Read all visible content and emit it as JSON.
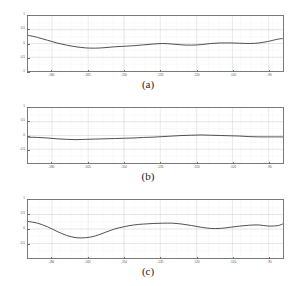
{
  "figure": {
    "background": "#ffffff",
    "line_color": "#3a3a3a",
    "grid_color": "#cfcfcf",
    "axis_color": "#7a7a7a"
  },
  "panels": [
    {
      "caption": "(a)",
      "chart_data": {
        "type": "line",
        "title": "",
        "xlabel": "",
        "ylabel": "",
        "xlim": [
          -190,
          -84
        ],
        "ylim": [
          -1.0,
          1.0
        ],
        "xticks": [
          -180,
          -165,
          -150,
          -135,
          -120,
          -105,
          -90
        ],
        "xticklabels": [
          "-180",
          "-165",
          "-150",
          "-135",
          "-120",
          "-105",
          "-90"
        ],
        "yticks": [
          -1,
          -0.5,
          0,
          0.5,
          1
        ],
        "yticklabels": [
          "-1",
          "-0.5",
          "0",
          "0.5",
          "1"
        ],
        "grid": true,
        "legend": "none",
        "series": [
          {
            "name": "curve-a",
            "x": [
              -190,
              -186,
              -182,
              -178,
              -174,
              -170,
              -166,
              -162,
              -158,
              -154,
              -150,
              -146,
              -142,
              -138,
              -134,
              -130,
              -126,
              -122,
              -118,
              -114,
              -110,
              -106,
              -102,
              -98,
              -94,
              -90,
              -86,
              -84
            ],
            "y": [
              0.3,
              0.22,
              0.12,
              0.02,
              -0.06,
              -0.12,
              -0.16,
              -0.17,
              -0.15,
              -0.12,
              -0.1,
              -0.08,
              -0.05,
              -0.02,
              0.0,
              -0.02,
              -0.05,
              -0.06,
              -0.04,
              0.0,
              0.02,
              0.02,
              0.01,
              0.0,
              0.02,
              0.08,
              0.16,
              0.18
            ]
          }
        ]
      }
    },
    {
      "caption": "(b)",
      "chart_data": {
        "type": "line",
        "title": "",
        "xlabel": "",
        "ylabel": "",
        "xlim": [
          -190,
          -84
        ],
        "ylim": [
          -1.0,
          1.0
        ],
        "xticks": [
          -180,
          -165,
          -150,
          -135,
          -120,
          -105,
          -90
        ],
        "xticklabels": [
          "-180",
          "-165",
          "-150",
          "-135",
          "-120",
          "-105",
          "-90"
        ],
        "yticks": [
          -0.5,
          0,
          0.5,
          1
        ],
        "yticklabels": [
          "-0.5",
          "0",
          "0.5",
          "1"
        ],
        "grid": true,
        "legend": "none",
        "series": [
          {
            "name": "curve-b",
            "x": [
              -190,
              -186,
              -182,
              -178,
              -174,
              -170,
              -166,
              -162,
              -158,
              -154,
              -150,
              -146,
              -142,
              -138,
              -134,
              -130,
              -126,
              -122,
              -118,
              -114,
              -110,
              -106,
              -102,
              -98,
              -94,
              -90,
              -86,
              -84
            ],
            "y": [
              -0.06,
              -0.07,
              -0.09,
              -0.12,
              -0.14,
              -0.15,
              -0.14,
              -0.13,
              -0.12,
              -0.11,
              -0.1,
              -0.09,
              -0.07,
              -0.06,
              -0.04,
              -0.02,
              0.0,
              0.01,
              0.02,
              0.01,
              0.0,
              -0.01,
              -0.02,
              -0.04,
              -0.05,
              -0.05,
              -0.05,
              -0.05
            ]
          }
        ]
      }
    },
    {
      "caption": "(c)",
      "chart_data": {
        "type": "line",
        "title": "",
        "xlabel": "",
        "ylabel": "",
        "xlim": [
          -190,
          -84
        ],
        "ylim": [
          -1.0,
          1.0
        ],
        "xticks": [
          -180,
          -165,
          -150,
          -135,
          -120,
          -105,
          -90
        ],
        "xticklabels": [
          "-180",
          "-165",
          "-150",
          "-135",
          "-120",
          "-105",
          "-90"
        ],
        "yticks": [
          -0.5,
          0,
          0.5,
          1
        ],
        "yticklabels": [
          "-0.5",
          "0",
          "0.5",
          "1"
        ],
        "grid": true,
        "legend": "none",
        "series": [
          {
            "name": "curve-c",
            "x": [
              -190,
              -186,
              -182,
              -178,
              -174,
              -170,
              -166,
              -162,
              -158,
              -154,
              -150,
              -146,
              -142,
              -138,
              -134,
              -130,
              -126,
              -122,
              -118,
              -114,
              -110,
              -106,
              -102,
              -98,
              -94,
              -90,
              -86,
              -84
            ],
            "y": [
              0.26,
              0.2,
              0.08,
              -0.08,
              -0.22,
              -0.3,
              -0.3,
              -0.24,
              -0.12,
              0.0,
              0.08,
              0.14,
              0.17,
              0.19,
              0.2,
              0.2,
              0.17,
              0.12,
              0.06,
              0.02,
              0.02,
              0.06,
              0.1,
              0.13,
              0.14,
              0.1,
              0.12,
              0.18
            ]
          }
        ]
      }
    }
  ]
}
